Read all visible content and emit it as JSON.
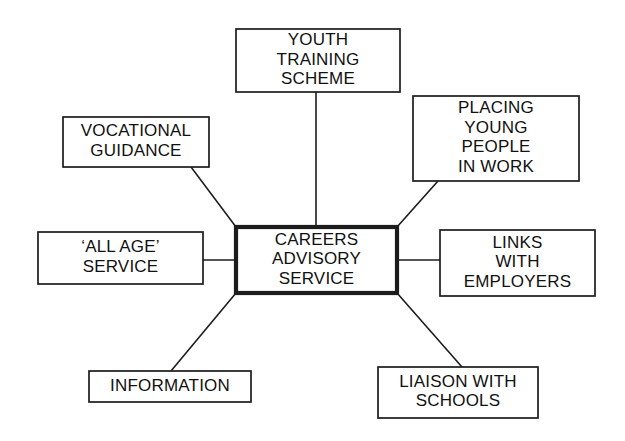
{
  "diagram": {
    "type": "hub-and-spoke",
    "canvas": {
      "width": 625,
      "height": 441
    },
    "colors": {
      "background": "#ffffff",
      "box_stroke": "#1c1c1c",
      "box_fill": "#ffffff",
      "text": "#111111",
      "connector": "#1c1c1c"
    },
    "center": {
      "id": "careers-advisory-service",
      "lines": [
        "CAREERS",
        "ADVISORY",
        "SERVICE"
      ],
      "text": "CAREERS ADVISORY SERVICE",
      "x": 236,
      "y": 227,
      "width": 161,
      "height": 66,
      "emphasis": "thick-border"
    },
    "nodes": [
      {
        "id": "youth-training-scheme",
        "lines": [
          "YOUTH",
          "TRAINING",
          "SCHEME"
        ],
        "text": "YOUTH TRAINING SCHEME",
        "x": 236,
        "y": 29,
        "width": 164,
        "height": 63,
        "position": "top"
      },
      {
        "id": "placing-young-people-in-work",
        "lines": [
          "PLACING",
          "YOUNG",
          "PEOPLE",
          "IN WORK"
        ],
        "text": "PLACING YOUNG PEOPLE IN WORK",
        "x": 413,
        "y": 96,
        "width": 166,
        "height": 85,
        "position": "top-right"
      },
      {
        "id": "vocational-guidance",
        "lines": [
          "VOCATIONAL",
          "GUIDANCE"
        ],
        "text": "VOCATIONAL GUIDANCE",
        "x": 63,
        "y": 117,
        "width": 146,
        "height": 50,
        "position": "top-left"
      },
      {
        "id": "all-age-service",
        "lines": [
          "‘ALL AGE’",
          "SERVICE"
        ],
        "text": "‘ALL AGE’ SERVICE",
        "x": 38,
        "y": 232,
        "width": 165,
        "height": 52,
        "position": "left"
      },
      {
        "id": "links-with-employers",
        "lines": [
          "LINKS",
          "WITH",
          "EMPLOYERS"
        ],
        "text": "LINKS WITH EMPLOYERS",
        "x": 440,
        "y": 230,
        "width": 155,
        "height": 66,
        "position": "right"
      },
      {
        "id": "information",
        "lines": [
          "INFORMATION"
        ],
        "text": "INFORMATION",
        "x": 89,
        "y": 371,
        "width": 162,
        "height": 31,
        "position": "bottom-left"
      },
      {
        "id": "liaison-with-schools",
        "lines": [
          "LIAISON WITH",
          "SCHOOLS"
        ],
        "text": "LIAISON WITH SCHOOLS",
        "x": 378,
        "y": 367,
        "width": 160,
        "height": 51,
        "position": "bottom-right"
      }
    ],
    "connectors": [
      {
        "id": "connector-youth-training-scheme",
        "from": "youth-training-scheme",
        "to": "careers-advisory-service",
        "x1": 316,
        "y1": 92,
        "x2": 316,
        "y2": 227
      },
      {
        "id": "connector-placing-young-people-in-work",
        "from": "placing-young-people-in-work",
        "to": "careers-advisory-service",
        "x1": 438,
        "y1": 181,
        "x2": 397,
        "y2": 227
      },
      {
        "id": "connector-vocational-guidance",
        "from": "vocational-guidance",
        "to": "careers-advisory-service",
        "x1": 191,
        "y1": 167,
        "x2": 236,
        "y2": 227
      },
      {
        "id": "connector-all-age-service",
        "from": "all-age-service",
        "to": "careers-advisory-service",
        "x1": 203,
        "y1": 260,
        "x2": 236,
        "y2": 260
      },
      {
        "id": "connector-links-with-employers",
        "from": "careers-advisory-service",
        "to": "links-with-employers",
        "x1": 397,
        "y1": 260,
        "x2": 440,
        "y2": 260
      },
      {
        "id": "connector-information",
        "from": "careers-advisory-service",
        "to": "information",
        "x1": 236,
        "y1": 293,
        "x2": 171,
        "y2": 371
      },
      {
        "id": "connector-liaison-with-schools",
        "from": "careers-advisory-service",
        "to": "liaison-with-schools",
        "x1": 397,
        "y1": 293,
        "x2": 462,
        "y2": 367
      }
    ]
  }
}
